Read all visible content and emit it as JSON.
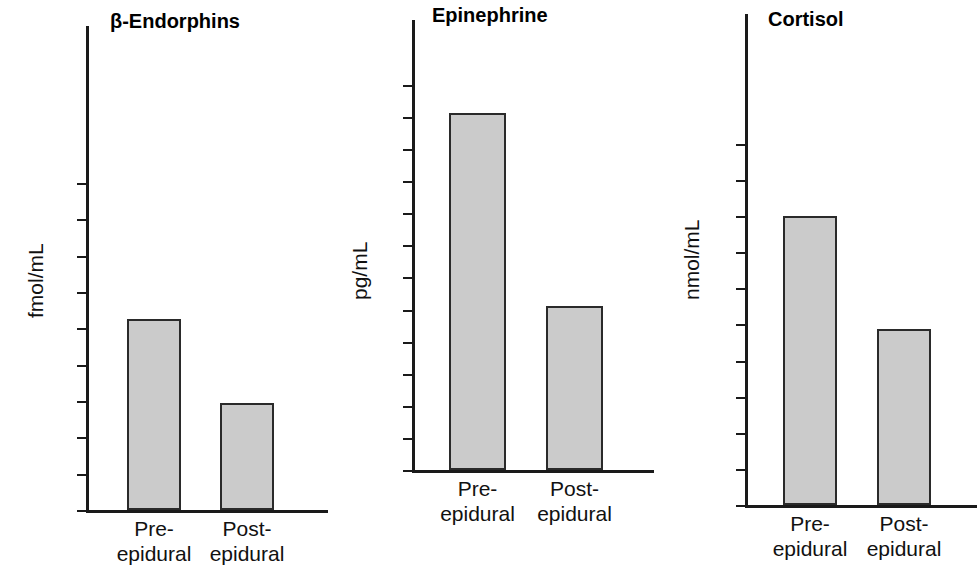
{
  "figure": {
    "background": "#ffffff",
    "bar_fill": "#cbcbcb",
    "bar_stroke": "#2a2a2a",
    "axis_color": "#1a1a1a"
  },
  "chart_data": [
    {
      "type": "bar",
      "title": "β-Endorphins",
      "xlabel": "",
      "ylabel": "fmol/mL",
      "categories": [
        "Pre-\nepidural",
        "Post-\nepidural"
      ],
      "category_lines": [
        [
          "Pre-",
          "epidural"
        ],
        [
          "Post-",
          "epidural"
        ]
      ],
      "values": [
        52.5,
        29.5
      ],
      "ylim": [
        0,
        103
      ],
      "yticks": [
        0,
        10,
        20,
        30,
        40,
        50,
        60,
        70,
        80,
        90
      ],
      "yticklabels": [
        "0",
        "10",
        "20",
        "30",
        "40",
        "50",
        "60",
        "70",
        "80",
        "90"
      ],
      "grid": false,
      "legend": "none"
    },
    {
      "type": "bar",
      "title": "Epinephrine",
      "xlabel": "",
      "ylabel": "pg/mL",
      "categories": [
        "Pre-\nepidural",
        "Post-\nepidural"
      ],
      "category_lines": [
        [
          "Pre-",
          "epidural"
        ],
        [
          "Post-",
          "epidural"
        ]
      ],
      "values": [
        278,
        128
      ],
      "ylim": [
        0,
        325
      ],
      "yticks": [
        0,
        25,
        50,
        75,
        100,
        125,
        150,
        175,
        200,
        225,
        250,
        275,
        300
      ],
      "yticklabels": [
        "0",
        "25",
        "50",
        "75",
        "100",
        "125",
        "150",
        "175",
        "200",
        "225",
        "250",
        "275",
        "300"
      ],
      "grid": false,
      "legend": "none"
    },
    {
      "type": "bar",
      "title": "Cortisol",
      "xlabel": "",
      "ylabel": "nmol/mL",
      "categories": [
        "Pre-\nepidural",
        "Post-\nepidural"
      ],
      "category_lines": [
        [
          "Pre-",
          "epidural"
        ],
        [
          "Post-",
          "epidural"
        ]
      ],
      "values": [
        2400,
        1460
      ],
      "ylim": [
        0,
        3450
      ],
      "yticks": [
        0,
        300,
        600,
        900,
        1200,
        1500,
        1800,
        2100,
        2400,
        2700,
        3000
      ],
      "yticklabels": [
        "0",
        "300",
        "600",
        "900",
        "1200",
        "1500",
        "1800",
        "2100",
        "2400",
        "2700",
        "3000"
      ],
      "grid": false,
      "legend": "none"
    }
  ],
  "layout": {
    "panels": [
      {
        "left": 0,
        "axis_x": 86,
        "baseline_y": 510,
        "axis_top": 26,
        "title_x": 110,
        "title_y": 10,
        "ylabel_x": 24,
        "ylabel_y": 318,
        "bar_width": 54,
        "bar1_x": 127,
        "bar2_x": 220,
        "tick_unit_px": 3.633,
        "cat_y": 516
      },
      {
        "left": 330,
        "axis_x": 412,
        "baseline_y": 470,
        "axis_top": 20,
        "title_x": 432,
        "title_y": 4,
        "ylabel_x": 348,
        "ylabel_y": 300,
        "bar_width": 57,
        "bar1_x": 449,
        "bar2_x": 546,
        "tick_unit_px": 1.284,
        "cat_y": 476
      },
      {
        "left": 650,
        "axis_x": 745,
        "baseline_y": 505,
        "axis_top": 14,
        "title_x": 768,
        "title_y": 8,
        "ylabel_x": 680,
        "ylabel_y": 300,
        "bar_width": 54,
        "bar1_x": 783,
        "bar2_x": 877,
        "tick_unit_px": 0.1204,
        "cat_y": 511
      }
    ]
  }
}
